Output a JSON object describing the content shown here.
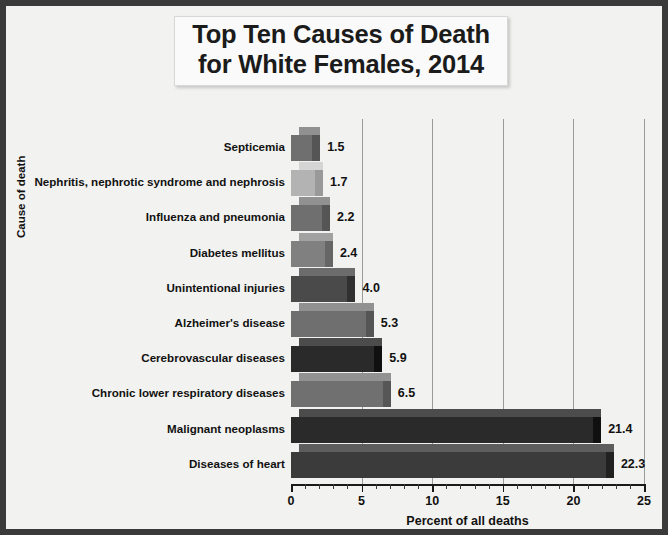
{
  "chart_data": {
    "type": "bar",
    "orientation": "horizontal",
    "title": "Top Ten Causes of Death for White Females, 2014",
    "title_lines": [
      "Top Ten Causes of Death",
      "for White Females, 2014"
    ],
    "xlabel": "Percent of all deaths",
    "ylabel": "Cause of death",
    "xlim": [
      0,
      25
    ],
    "xticks": [
      0,
      5,
      10,
      15,
      20,
      25
    ],
    "xtick_labels": [
      "0",
      "5",
      "10",
      "15",
      "20",
      "25"
    ],
    "minor_tick_interval": 1,
    "grid": "vertical-major",
    "legend": "none",
    "categories": [
      "Septicemia",
      "Nephritis, nephrotic syndrome and nephrosis",
      "Influenza and pneumonia",
      "Diabetes mellitus",
      "Unintentional injuries",
      "Alzheimer's disease",
      "Cerebrovascular diseases",
      "Chronic lower respiratory diseases",
      "Malignant neoplasms",
      "Diseases of heart"
    ],
    "values": [
      1.5,
      1.7,
      2.2,
      2.4,
      4.0,
      5.3,
      5.9,
      6.5,
      21.4,
      22.3
    ],
    "value_labels": [
      "1.5",
      "1.7",
      "2.2",
      "2.4",
      "4.0",
      "5.3",
      "5.9",
      "6.5",
      "21.4",
      "22.3"
    ],
    "bar_colors": [
      "#6f6f6f",
      "#b3b3b3",
      "#6f6f6f",
      "#808080",
      "#4a4a4a",
      "#6f6f6f",
      "#2a2a2a",
      "#707070",
      "#2a2a2a",
      "#3b3b3b"
    ],
    "colors": {
      "frame_border": "#3a3a3a",
      "plot_background": "#f2f2f0",
      "gridline": "#9a9a9a",
      "axis": "#1a1a1a",
      "text": "#111111",
      "title_background": "#fafafa"
    }
  }
}
